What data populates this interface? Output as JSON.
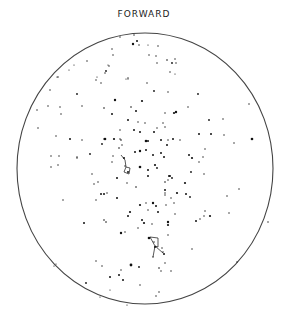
{
  "chart": {
    "title": "FORWARD",
    "circle": {
      "cx": 145,
      "cy": 168.5,
      "rx": 128,
      "ry": 135.5,
      "stroke": "#444444"
    },
    "star_color": "#111111",
    "stars": [
      [
        134,
        35,
        0.7
      ],
      [
        133,
        44,
        1.2
      ],
      [
        137,
        41,
        1
      ],
      [
        139,
        45,
        0.7
      ],
      [
        120,
        37,
        0.7
      ],
      [
        112,
        49,
        0.7
      ],
      [
        113,
        55,
        0.7
      ],
      [
        148,
        45,
        0.6
      ],
      [
        158,
        46,
        0.7
      ],
      [
        149,
        55,
        0.7
      ],
      [
        156,
        56,
        0.7
      ],
      [
        157,
        63,
        0.7
      ],
      [
        167,
        60,
        0.8
      ],
      [
        172,
        63,
        0.9
      ],
      [
        175,
        59,
        0.7
      ],
      [
        176,
        63,
        0.7
      ],
      [
        170,
        72,
        0.7
      ],
      [
        175,
        74,
        0.6
      ],
      [
        87,
        61,
        0.7
      ],
      [
        74,
        65,
        0.6
      ],
      [
        69,
        70,
        0.6
      ],
      [
        109,
        66,
        0.7
      ],
      [
        108,
        65,
        0.6
      ],
      [
        106,
        71,
        0.9
      ],
      [
        105,
        73,
        0.7
      ],
      [
        97,
        77,
        0.6
      ],
      [
        96,
        80,
        0.7
      ],
      [
        101,
        83,
        0.7
      ],
      [
        128,
        78,
        0.7
      ],
      [
        58,
        77,
        0.7
      ],
      [
        128,
        79,
        0.6
      ],
      [
        57,
        77,
        0.6
      ],
      [
        50,
        90,
        0.7
      ],
      [
        126,
        79,
        0.6
      ],
      [
        147,
        83,
        0.7
      ],
      [
        77,
        94,
        0.9
      ],
      [
        115,
        100,
        1.2
      ],
      [
        142,
        101,
        1.1
      ],
      [
        154,
        91,
        0.9
      ],
      [
        168,
        92,
        0.7
      ],
      [
        198,
        94,
        0.9
      ],
      [
        37,
        110,
        0.7
      ],
      [
        48,
        106,
        0.7
      ],
      [
        60,
        107,
        0.7
      ],
      [
        82,
        106,
        0.7
      ],
      [
        104,
        108,
        0.8
      ],
      [
        131,
        107,
        0.8
      ],
      [
        136,
        111,
        1
      ],
      [
        176,
        112,
        1.2
      ],
      [
        174,
        113,
        1.1
      ],
      [
        188,
        107,
        0.7
      ],
      [
        249,
        104,
        0.7
      ],
      [
        61,
        114,
        0.7
      ],
      [
        112,
        114,
        1
      ],
      [
        165,
        113,
        0.7
      ],
      [
        38,
        128,
        0.7
      ],
      [
        128,
        120,
        1
      ],
      [
        138,
        122,
        0.7
      ],
      [
        145,
        123,
        0.7
      ],
      [
        163,
        123,
        0.7
      ],
      [
        209,
        120,
        0.9
      ],
      [
        223,
        119,
        0.7
      ],
      [
        56,
        136,
        0.7
      ],
      [
        120,
        130,
        0.7
      ],
      [
        134,
        130,
        1
      ],
      [
        140,
        132,
        1
      ],
      [
        154,
        132,
        1
      ],
      [
        157,
        128,
        0.7
      ],
      [
        165,
        127,
        0.7
      ],
      [
        121,
        140,
        0.8
      ],
      [
        199,
        134,
        1
      ],
      [
        211,
        134,
        1
      ],
      [
        224,
        135,
        0.7
      ],
      [
        104,
        139,
        0.7
      ],
      [
        70,
        139,
        1
      ],
      [
        82,
        140,
        0.7
      ],
      [
        105,
        139,
        1.3
      ],
      [
        114,
        139,
        1.1
      ],
      [
        102,
        144,
        0.9
      ],
      [
        120,
        139,
        0.7
      ],
      [
        146,
        141,
        1.3
      ],
      [
        148,
        141,
        1
      ],
      [
        161,
        140,
        1
      ],
      [
        168,
        140,
        0.7
      ],
      [
        173,
        139,
        1
      ],
      [
        180,
        140,
        0.7
      ],
      [
        167,
        145,
        1
      ],
      [
        122,
        145,
        0.7
      ],
      [
        119,
        148,
        0.8
      ],
      [
        252,
        139,
        1.3
      ],
      [
        234,
        143,
        0.7
      ],
      [
        51,
        156,
        0.7
      ],
      [
        77,
        157,
        0.7
      ],
      [
        90,
        154,
        0.9
      ],
      [
        113,
        156,
        0.7
      ],
      [
        135,
        152,
        1
      ],
      [
        140,
        151,
        1.2
      ],
      [
        146,
        150,
        1
      ],
      [
        153,
        155,
        1
      ],
      [
        161,
        153,
        1
      ],
      [
        164,
        157,
        1
      ],
      [
        189,
        155,
        1
      ],
      [
        192,
        158,
        1.1
      ],
      [
        203,
        157,
        0.7
      ],
      [
        205,
        149,
        0.7
      ],
      [
        59,
        156,
        0.7
      ],
      [
        51,
        167,
        0.7
      ],
      [
        58,
        165,
        0.7
      ],
      [
        77,
        158,
        0.7
      ],
      [
        112,
        162,
        0.7
      ],
      [
        124,
        158,
        1
      ],
      [
        140,
        167,
        1.3
      ],
      [
        148,
        170,
        1
      ],
      [
        155,
        165,
        1.1
      ],
      [
        157,
        168,
        0.9
      ],
      [
        125,
        166,
        0.7
      ],
      [
        128,
        172,
        1
      ],
      [
        148,
        176,
        1
      ],
      [
        169,
        176,
        1
      ],
      [
        168,
        180,
        0.7
      ],
      [
        172,
        178,
        0.9
      ],
      [
        165,
        182,
        0.8
      ],
      [
        170,
        176,
        1
      ],
      [
        191,
        172,
        0.9
      ],
      [
        204,
        174,
        0.7
      ],
      [
        199,
        162,
        0.7
      ],
      [
        92,
        174,
        0.7
      ],
      [
        98,
        182,
        0.7
      ],
      [
        117,
        178,
        1
      ],
      [
        127,
        183,
        0.7
      ],
      [
        136,
        187,
        0.8
      ],
      [
        94,
        184,
        0.7
      ],
      [
        185,
        183,
        1.1
      ],
      [
        165,
        190,
        1
      ],
      [
        239,
        189,
        0.7
      ],
      [
        101,
        194,
        1
      ],
      [
        104,
        194,
        1
      ],
      [
        107,
        193,
        0.7
      ],
      [
        117,
        198,
        1
      ],
      [
        96,
        200,
        0.7
      ],
      [
        63,
        200,
        0.7
      ],
      [
        165,
        193,
        0.7
      ],
      [
        165,
        195,
        0.7
      ],
      [
        171,
        198,
        0.7
      ],
      [
        177,
        193,
        1.1
      ],
      [
        186,
        194,
        1
      ],
      [
        190,
        197,
        0.9
      ],
      [
        227,
        196,
        0.7
      ],
      [
        146,
        203,
        0.7
      ],
      [
        153,
        203,
        1.2
      ],
      [
        156,
        206,
        1
      ],
      [
        166,
        205,
        0.7
      ],
      [
        174,
        203,
        0.7
      ],
      [
        140,
        205,
        1.1
      ],
      [
        148,
        210,
        0.7
      ],
      [
        158,
        212,
        1
      ],
      [
        175,
        214,
        0.7
      ],
      [
        130,
        212,
        1.1
      ],
      [
        128,
        216,
        1
      ],
      [
        229,
        213,
        0.7
      ],
      [
        210,
        216,
        1.1
      ],
      [
        205,
        211,
        0.7
      ],
      [
        200,
        219,
        0.7
      ],
      [
        84,
        223,
        1
      ],
      [
        104,
        220,
        0.8
      ],
      [
        106,
        222,
        0.8
      ],
      [
        142,
        220,
        1
      ],
      [
        144,
        223,
        1.1
      ],
      [
        152,
        224,
        0.7
      ],
      [
        168,
        222,
        1.2
      ],
      [
        168,
        225,
        1.1
      ],
      [
        196,
        221,
        1
      ],
      [
        204,
        216,
        0.7
      ],
      [
        138,
        228,
        0.7
      ],
      [
        121,
        233,
        1.2
      ],
      [
        125,
        232,
        0.7
      ],
      [
        168,
        235,
        0.7
      ],
      [
        268,
        222,
        0.7
      ],
      [
        149,
        238,
        1.3
      ],
      [
        154,
        242,
        0.7
      ],
      [
        155,
        247,
        1
      ],
      [
        162,
        248,
        0.7
      ],
      [
        164,
        254,
        1
      ],
      [
        153,
        257,
        0.7
      ],
      [
        163,
        252,
        0.7
      ],
      [
        192,
        249,
        0.7
      ],
      [
        165,
        263,
        0.7
      ],
      [
        96,
        261,
        0.7
      ],
      [
        102,
        266,
        0.7
      ],
      [
        131,
        265,
        1.4
      ],
      [
        139,
        267,
        0.9
      ],
      [
        159,
        268,
        0.8
      ],
      [
        161,
        271,
        0.7
      ],
      [
        171,
        271,
        0.7
      ],
      [
        237,
        262,
        0.7
      ],
      [
        110,
        277,
        1
      ],
      [
        119,
        275,
        1
      ],
      [
        121,
        270,
        0.7
      ],
      [
        123,
        280,
        1
      ],
      [
        86,
        283,
        0.9
      ],
      [
        140,
        285,
        0.7
      ],
      [
        110,
        290,
        0.6
      ],
      [
        156,
        296,
        0.7
      ],
      [
        159,
        292,
        0.7
      ],
      [
        100,
        297,
        0.6
      ],
      [
        127,
        305,
        0.6
      ],
      [
        56,
        264,
        0.6
      ],
      [
        54,
        266,
        0.6
      ]
    ],
    "constellations": [
      {
        "name": "upper-figure",
        "segments": [
          [
            121,
            155,
            125,
            160
          ],
          [
            125,
            160,
            126,
            167
          ],
          [
            126,
            167,
            124,
            172
          ],
          [
            124,
            172,
            129,
            174
          ],
          [
            129,
            174,
            130,
            168
          ],
          [
            130,
            168,
            126,
            167
          ]
        ]
      },
      {
        "name": "lower-figure",
        "segments": [
          [
            150,
            237,
            158,
            238
          ],
          [
            158,
            238,
            158,
            247
          ],
          [
            150,
            237,
            155,
            246
          ],
          [
            155,
            246,
            158,
            247
          ],
          [
            155,
            246,
            153,
            257
          ],
          [
            155,
            246,
            163,
            253
          ]
        ]
      }
    ]
  }
}
